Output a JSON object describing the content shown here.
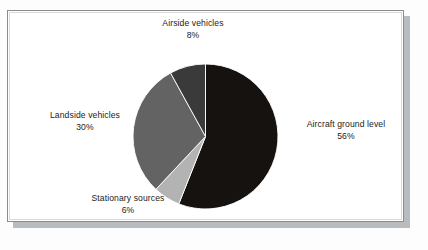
{
  "chart_data": {
    "type": "pie",
    "title": "",
    "subtitle": "",
    "xlabel": "",
    "ylabel": "",
    "legend_position": "none",
    "labels_position": "outside-callout",
    "start_angle_deg": 0,
    "direction": "clockwise",
    "categories": [
      "Aircraft ground level",
      "Stationary sources",
      "Landside vehicles",
      "Airside vehicles"
    ],
    "values": [
      56,
      30,
      8,
      6
    ],
    "slices": [
      {
        "label": "Aircraft ground level",
        "value": 56,
        "value_text": "56%",
        "color": "#151210"
      },
      {
        "label": "Stationary sources",
        "value": 6,
        "value_text": "6%",
        "color": "#b3b3b3"
      },
      {
        "label": "Landside vehicles",
        "value": 30,
        "value_text": "30%",
        "color": "#636363"
      },
      {
        "label": "Airside vehicles",
        "value": 8,
        "value_text": "8%",
        "color": "#3a3a3a"
      }
    ]
  },
  "labels": {
    "airside": {
      "name": "Airside vehicles",
      "value": "8%"
    },
    "aircraft": {
      "name": "Aircraft ground level",
      "value": "56%"
    },
    "landside": {
      "name": "Landside vehicles",
      "value": "30%"
    },
    "stationary": {
      "name": "Stationary sources",
      "value": "6%"
    }
  },
  "colors": {
    "page_background": "#fdfdfd",
    "frame_background": "#ffffff",
    "frame_border": "#8a8d90",
    "frame_inner_border": "#d9dadb",
    "frame_shadow": "#b9bcbe",
    "text": "#1b1b1b",
    "slice_aircraft": "#151210",
    "slice_landside": "#636363",
    "slice_airside": "#3a3a3a",
    "slice_stationary": "#b3b3b3"
  }
}
